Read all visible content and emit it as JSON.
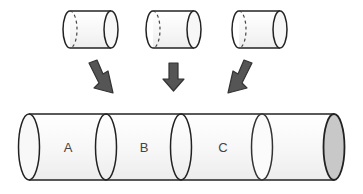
{
  "diagram": {
    "type": "assembly",
    "pieces": [
      {
        "id": "piece-1"
      },
      {
        "id": "piece-2"
      },
      {
        "id": "piece-3"
      }
    ],
    "arrows": [
      {
        "id": "arrow-left",
        "direction": "down-right"
      },
      {
        "id": "arrow-middle",
        "direction": "down"
      },
      {
        "id": "arrow-right",
        "direction": "down-left"
      }
    ],
    "tube": {
      "segments": [
        {
          "label": "A"
        },
        {
          "label": "B"
        },
        {
          "label": "C"
        },
        {
          "label": ""
        }
      ],
      "end_cap_color": "#c8c8c8"
    },
    "colors": {
      "outline": "#222222",
      "arrow_fill": "#555555",
      "body_fill": "#f4f4f4"
    }
  }
}
